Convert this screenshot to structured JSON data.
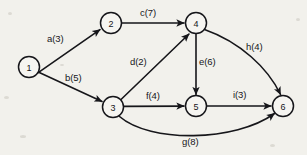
{
  "diagram": {
    "background_color": "#f2f1ec",
    "stroke_color": "#16161a",
    "node_fill_color": "#f6f5f1",
    "nodes": [
      {
        "id": "1",
        "label": "1",
        "cx": 29,
        "cy": 67,
        "r": 10.5
      },
      {
        "id": "2",
        "label": "2",
        "cx": 111,
        "cy": 23,
        "r": 10.5
      },
      {
        "id": "3",
        "label": "3",
        "cx": 113,
        "cy": 107,
        "r": 10.5
      },
      {
        "id": "4",
        "label": "4",
        "cx": 196,
        "cy": 23,
        "r": 10.5
      },
      {
        "id": "5",
        "label": "5",
        "cx": 196,
        "cy": 106,
        "r": 10.5
      },
      {
        "id": "6",
        "label": "6",
        "cx": 283,
        "cy": 106,
        "r": 10.5
      }
    ],
    "edges": [
      {
        "id": "a",
        "from": "1",
        "to": "2",
        "name": "a",
        "weight": 3,
        "label": "a(3)",
        "label_x": 47,
        "label_y": 33
      },
      {
        "id": "b",
        "from": "1",
        "to": "3",
        "name": "b",
        "weight": 5,
        "label": "b(5)",
        "label_x": 65,
        "label_y": 72
      },
      {
        "id": "c",
        "from": "2",
        "to": "4",
        "name": "c",
        "weight": 7,
        "label": "c(7)",
        "label_x": 140,
        "label_y": 7
      },
      {
        "id": "d",
        "from": "3",
        "to": "4",
        "name": "d",
        "weight": 2,
        "label": "d(2)",
        "label_x": 130,
        "label_y": 56
      },
      {
        "id": "e",
        "from": "4",
        "to": "5",
        "name": "e",
        "weight": 6,
        "label": "e(6)",
        "label_x": 199,
        "label_y": 56
      },
      {
        "id": "f",
        "from": "3",
        "to": "5",
        "name": "f",
        "weight": 4,
        "label": "f(4)",
        "label_x": 146,
        "label_y": 90
      },
      {
        "id": "g",
        "from": "3",
        "to": "6",
        "name": "g",
        "weight": 8,
        "label": "g(8)",
        "label_x": 182,
        "label_y": 136
      },
      {
        "id": "h",
        "from": "4",
        "to": "6",
        "name": "h",
        "weight": 4,
        "label": "h(4)",
        "label_x": 246,
        "label_y": 41
      },
      {
        "id": "i",
        "from": "5",
        "to": "6",
        "name": "i",
        "weight": 3,
        "label": "i(3)",
        "label_x": 233,
        "label_y": 89
      }
    ]
  }
}
